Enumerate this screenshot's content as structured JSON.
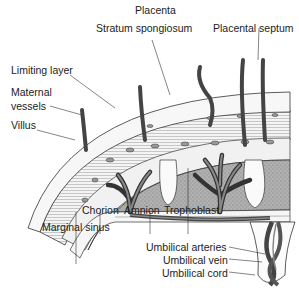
{
  "labels": {
    "placenta": "Placenta",
    "stratum_spongiosum": "Stratum spongiosum",
    "placental_septum": "Placental septum",
    "limiting_layer": "Limiting layer",
    "maternal_vessels_1": "Maternal",
    "maternal_vessels_2": "vessels",
    "villus": "Villus",
    "chorion": "Chorion",
    "amnion": "Amnion",
    "trophoblast": "Trophoblast",
    "marginal_sinus": "Marginal sinus",
    "umbilical_arteries": "Umbilical arteries",
    "umbilical_vein": "Umbilical vein",
    "umbilical_cord": "Umbilical cord"
  },
  "colors": {
    "outline": "#222222",
    "intervillous": "#a8a8a8",
    "vessel": "#555555",
    "light_tissue": "#eeeeee"
  }
}
